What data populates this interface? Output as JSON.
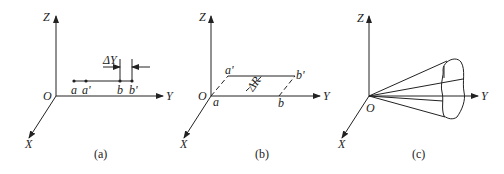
{
  "panels": [
    {
      "id": "a",
      "caption": "(a)",
      "axes": {
        "z": "Z",
        "y": "Y",
        "x": "X",
        "origin": "O"
      },
      "points": {
        "a": "a",
        "a_prime": "a'",
        "b": "b",
        "b_prime": "b'"
      },
      "annotation": "ΔY"
    },
    {
      "id": "b",
      "caption": "(b)",
      "axes": {
        "z": "Z",
        "y": "Y",
        "x": "X",
        "origin": "O"
      },
      "points": {
        "a": "a",
        "a_prime": "a'",
        "b": "b",
        "b_prime": "b'"
      },
      "annotation": "ΔR"
    },
    {
      "id": "c",
      "caption": "(c)",
      "axes": {
        "z": "Z",
        "y": "Y",
        "x": "X",
        "origin": "O"
      }
    }
  ]
}
